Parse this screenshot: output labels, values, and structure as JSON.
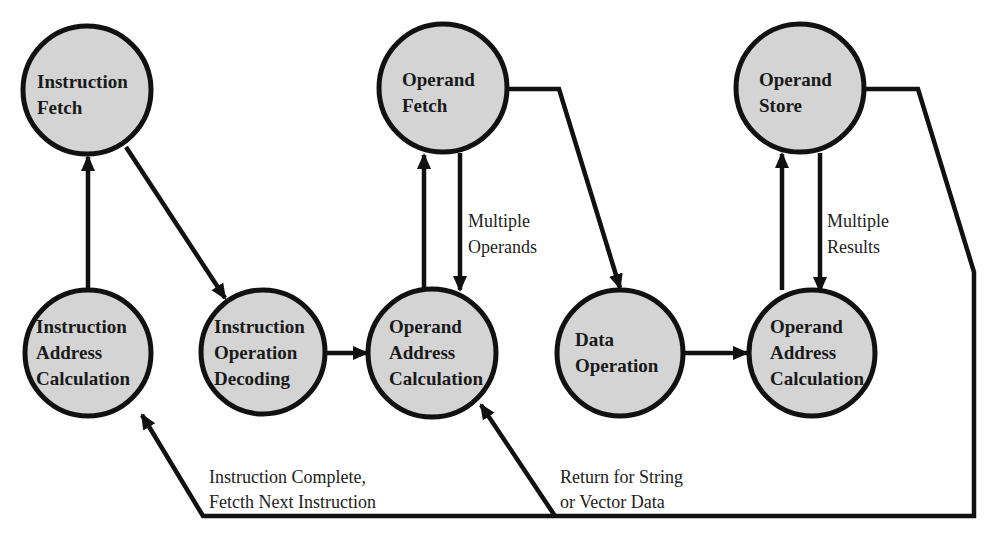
{
  "diagram": {
    "colors": {
      "node_fill": "#d4d4d4",
      "node_stroke": "#111111",
      "background": "#ffffff"
    },
    "nodes": [
      {
        "id": "if",
        "lines": [
          "Instruction",
          "Fetch"
        ]
      },
      {
        "id": "of",
        "lines": [
          "Operand",
          "Fetch"
        ]
      },
      {
        "id": "os",
        "lines": [
          "Operand",
          "Store"
        ]
      },
      {
        "id": "iac",
        "lines": [
          "Instruction",
          "Address",
          "Calculation"
        ]
      },
      {
        "id": "iod",
        "lines": [
          "Instruction",
          "Operation",
          "Decoding"
        ]
      },
      {
        "id": "oac1",
        "lines": [
          "Operand",
          "Address",
          "Calculation"
        ]
      },
      {
        "id": "do",
        "lines": [
          "Data",
          "Operation"
        ]
      },
      {
        "id": "oac2",
        "lines": [
          "Operand",
          "Address",
          "Calculation"
        ]
      }
    ],
    "edge_labels": {
      "multiple_operands": [
        "Multiple",
        "Operands"
      ],
      "multiple_results": [
        "Multiple",
        "Results"
      ],
      "instruction_complete": [
        "Instruction Complete,",
        "Fetcth Next Instruction"
      ],
      "return_string": [
        "Return for String",
        "or Vector Data"
      ]
    },
    "edges": [
      {
        "from": "iac",
        "to": "if"
      },
      {
        "from": "if",
        "to": "iod"
      },
      {
        "from": "iod",
        "to": "oac1"
      },
      {
        "from": "oac1",
        "to": "of"
      },
      {
        "from": "of",
        "to": "oac1",
        "label": "multiple_operands"
      },
      {
        "from": "of",
        "to": "do"
      },
      {
        "from": "do",
        "to": "oac2"
      },
      {
        "from": "oac2",
        "to": "os"
      },
      {
        "from": "os",
        "to": "oac2",
        "label": "multiple_results"
      },
      {
        "from": "os",
        "to": "iac",
        "label": "instruction_complete"
      },
      {
        "from": "os",
        "to": "oac1",
        "label": "return_string"
      }
    ]
  }
}
